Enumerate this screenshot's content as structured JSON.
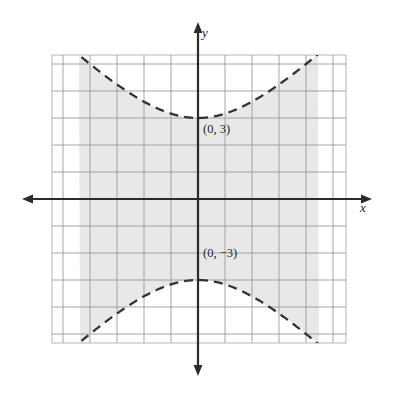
{
  "figure": {
    "title": "",
    "background_color": "#ffffff"
  },
  "axes": {
    "x_label": "x",
    "y_label": "y",
    "axis_color": "#2b2b2b",
    "origin_px": {
      "x": 198,
      "y": 199
    },
    "unit_px": 27,
    "x_arrow_left_px": 22,
    "x_arrow_right_px": 372,
    "y_arrow_top_px": 22,
    "y_arrow_bottom_px": 376
  },
  "grid": {
    "show": true,
    "color": "#9a9a9a",
    "minor_color": "#c8c8c8",
    "spacing_px": 27,
    "left_px": 52,
    "top_px": 55,
    "right_px": 346,
    "bottom_px": 343,
    "columns": 11,
    "rows": 11
  },
  "annotations": [
    {
      "id": "vertex-top",
      "text": "(0, 3)",
      "x": 0,
      "y": 3
    },
    {
      "id": "vertex-bottom",
      "text": "(0, −3)",
      "x": 0,
      "y": -3
    }
  ],
  "chart_data": {
    "type": "line",
    "title": "",
    "xlabel": "x",
    "ylabel": "y",
    "xlim": [
      -5.4,
      5.5
    ],
    "ylim": [
      -5.3,
      5.3
    ],
    "grid": true,
    "legend": null,
    "curve_style": "dashed",
    "curve_color": "#333333",
    "shading": {
      "color": "#e8e8e8",
      "description": "region between the two hyperbola branches",
      "clipped_to_grid": true
    },
    "relation": {
      "family": "hyperbola",
      "orientation": "vertical",
      "a": 3,
      "b": 3,
      "center": [
        0,
        0
      ],
      "vertices": [
        [
          0,
          3
        ],
        [
          0,
          -3
        ]
      ],
      "boundary": "dashed (strict inequality)"
    },
    "series": [
      {
        "name": "upper branch",
        "x": [
          -5.4,
          -4.5,
          -4.0,
          -3.5,
          -3.0,
          -2.5,
          -2.0,
          -1.5,
          -1.0,
          -0.5,
          0.0,
          0.5,
          1.0,
          1.5,
          2.0,
          2.5,
          3.0,
          3.5,
          4.0,
          4.5,
          5.4
        ],
        "y": [
          6.18,
          5.41,
          5.0,
          4.61,
          4.24,
          3.91,
          3.61,
          3.35,
          3.16,
          3.04,
          3.0,
          3.04,
          3.16,
          3.35,
          3.61,
          3.91,
          4.24,
          4.61,
          5.0,
          5.41,
          6.18
        ]
      },
      {
        "name": "lower branch",
        "x": [
          -5.4,
          -4.5,
          -4.0,
          -3.5,
          -3.0,
          -2.5,
          -2.0,
          -1.5,
          -1.0,
          -0.5,
          0.0,
          0.5,
          1.0,
          1.5,
          2.0,
          2.5,
          3.0,
          3.5,
          4.0,
          4.5,
          5.4
        ],
        "y": [
          -6.18,
          -5.41,
          -5.0,
          -4.61,
          -4.24,
          -3.91,
          -3.61,
          -3.35,
          -3.16,
          -3.04,
          -3.0,
          -3.04,
          -3.16,
          -3.35,
          -3.61,
          -3.91,
          -4.24,
          -4.61,
          -5.0,
          -5.41,
          -6.18
        ]
      }
    ],
    "annotations": [
      {
        "text": "(0, 3)",
        "x": 0,
        "y": 3
      },
      {
        "text": "(0, −3)",
        "x": 0,
        "y": -3
      }
    ]
  }
}
